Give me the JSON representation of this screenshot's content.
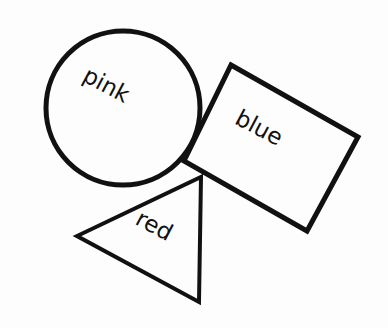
{
  "diagram": {
    "background": "#fdfdfd",
    "stroke_color": "#111111",
    "shapes": [
      {
        "type": "circle",
        "label": "pink"
      },
      {
        "type": "rectangle",
        "label": "blue"
      },
      {
        "type": "triangle",
        "label": "red"
      }
    ]
  }
}
